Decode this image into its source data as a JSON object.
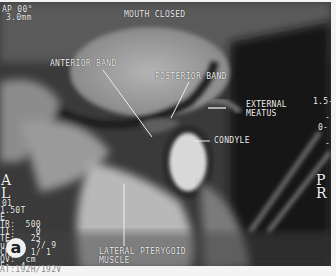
{
  "figure": {
    "panel_letter": "a",
    "title": "MOUTH CLOSED",
    "header_left": [
      "AP 00°",
      "3.0mm"
    ],
    "orientation": {
      "left": [
        "A",
        "L"
      ],
      "right": [
        "P",
        "R"
      ]
    },
    "scale_right": [
      "1.5-",
      "-",
      "0-",
      "-"
    ],
    "params_left": [
      "01",
      "1.50T",
      "E",
      "TR:  500",
      "TI:    0",
      "TE:   25",
      "ulti:  7/ 9",
      "CHO:  1/ 1",
      "OV:  cm",
      "E:  4",
      "AT:192H/192V"
    ],
    "labels": {
      "anterior_band": "ANTERIOR BAND",
      "posterior_band": "POSTERIOR BAND",
      "external_meatus": [
        "EXTERNAL",
        "MEATUS"
      ],
      "condyle": "CONDYLE",
      "lateral_pterygoid": [
        "LATERAL PTERYGOID",
        "MUSCLE"
      ]
    }
  }
}
